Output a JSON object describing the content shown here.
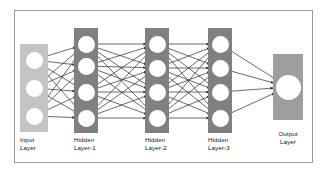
{
  "diagram": {
    "frame": {
      "border_color": "#9a9a9a",
      "background": "#ffffff"
    },
    "colors": {
      "input_box": "#c4c4c4",
      "hidden_box": "#808080",
      "output_box": "#9e9e9e",
      "node_fill": "#ffffff",
      "connection": "#2b2b2b",
      "label_text": "#111111"
    },
    "layers": [
      {
        "id": "input-layer",
        "label": "Input\nLayer",
        "label_line1": "Input",
        "label_line2": "Layer",
        "type": "input",
        "node_count": 3,
        "box": {
          "x": 20,
          "y": 44,
          "w": 28,
          "h": 88,
          "fill": "#c4c4c4"
        },
        "nodes": [
          {
            "cx": 34,
            "cy": 60,
            "r": 8.5
          },
          {
            "cx": 34,
            "cy": 88,
            "r": 8.5
          },
          {
            "cx": 34,
            "cy": 116,
            "r": 8.5
          }
        ],
        "label_pos": {
          "x": 20,
          "y": 136
        }
      },
      {
        "id": "hidden-layer-1",
        "label": "Hidden\nLayer-1",
        "label_line1": "Hidden",
        "label_line2": "Layer-1",
        "type": "hidden",
        "node_count": 4,
        "box": {
          "x": 74,
          "y": 28,
          "w": 24,
          "h": 105,
          "fill": "#808080"
        },
        "nodes": [
          {
            "cx": 86,
            "cy": 44,
            "r": 8.5
          },
          {
            "cx": 86,
            "cy": 66,
            "r": 8.5
          },
          {
            "cx": 86,
            "cy": 92,
            "r": 8.5
          },
          {
            "cx": 86,
            "cy": 118,
            "r": 8.5
          }
        ],
        "label_pos": {
          "x": 74,
          "y": 136
        }
      },
      {
        "id": "hidden-layer-2",
        "label": "Hidden\nLayer-2",
        "label_line1": "Hidden",
        "label_line2": "Layer-2",
        "type": "hidden",
        "node_count": 4,
        "box": {
          "x": 145,
          "y": 28,
          "w": 24,
          "h": 105,
          "fill": "#808080"
        },
        "nodes": [
          {
            "cx": 157,
            "cy": 44,
            "r": 8.5
          },
          {
            "cx": 157,
            "cy": 68,
            "r": 8.5
          },
          {
            "cx": 157,
            "cy": 92,
            "r": 8.5
          },
          {
            "cx": 157,
            "cy": 118,
            "r": 8.5
          }
        ],
        "label_pos": {
          "x": 145,
          "y": 136
        }
      },
      {
        "id": "hidden-layer-3",
        "label": "Hidden\nLayer-3",
        "label_line1": "Hidden",
        "label_line2": "Layer-3",
        "type": "hidden",
        "node_count": 4,
        "box": {
          "x": 208,
          "y": 28,
          "w": 24,
          "h": 105,
          "fill": "#808080"
        },
        "nodes": [
          {
            "cx": 220,
            "cy": 44,
            "r": 8.5
          },
          {
            "cx": 220,
            "cy": 68,
            "r": 8.5
          },
          {
            "cx": 220,
            "cy": 92,
            "r": 8.5
          },
          {
            "cx": 220,
            "cy": 118,
            "r": 8.5
          }
        ],
        "label_pos": {
          "x": 208,
          "y": 136
        }
      },
      {
        "id": "output-layer",
        "label": "Output\nLayer",
        "label_line1": "Output",
        "label_line2": "Layer",
        "type": "output",
        "node_count": 1,
        "box": {
          "x": 273,
          "y": 54,
          "w": 30,
          "h": 66,
          "fill": "#9e9e9e"
        },
        "nodes": [
          {
            "cx": 288,
            "cy": 87,
            "r": 12.5
          }
        ],
        "label_pos": {
          "x": 273,
          "y": 130
        }
      }
    ],
    "connections": {
      "style": "directed-arrow",
      "arrowhead": "filled-triangle",
      "fully_connected_between": [
        [
          "input-layer",
          "hidden-layer-1"
        ],
        [
          "hidden-layer-1",
          "hidden-layer-2"
        ],
        [
          "hidden-layer-2",
          "hidden-layer-3"
        ],
        [
          "hidden-layer-3",
          "output-layer"
        ]
      ],
      "total_edges": 40
    }
  }
}
